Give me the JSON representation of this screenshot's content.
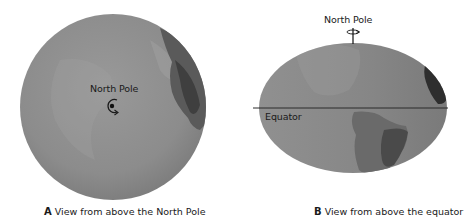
{
  "figure": {
    "panels": [
      {
        "letter": "A",
        "caption": "View from above the North Pole",
        "labels": {
          "pole": "North Pole"
        },
        "icons": [
          "globe-polar-view",
          "rotation-arrow-icon",
          "pole-dot-icon"
        ]
      },
      {
        "letter": "B",
        "caption": "View from above the equator",
        "labels": {
          "pole": "North Pole",
          "equator": "Equator"
        },
        "icons": [
          "globe-equatorial-view",
          "rotation-axis-icon",
          "equator-line"
        ]
      }
    ],
    "colors": {
      "globe_base": "#8a8a8a",
      "globe_light": "#a3a3a3",
      "land_dark": "#3c3c3c",
      "land_mid": "#6e6e6e",
      "line": "#2a2a2a",
      "background": "#ffffff"
    }
  }
}
